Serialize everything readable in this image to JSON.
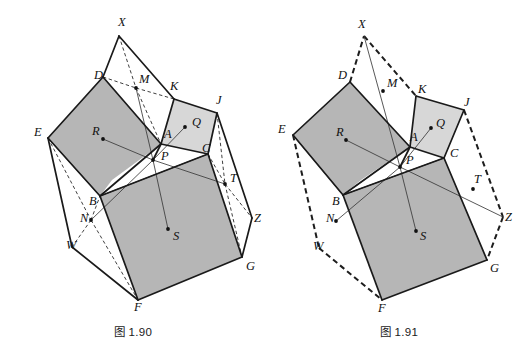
{
  "page": {
    "background": "#ffffff",
    "width": 532,
    "height": 357
  },
  "style": {
    "stroke_color": "#1a1a1a",
    "fill_dark_gray": "#b6b6b6",
    "fill_light_gray": "#d7d7d7",
    "fill_white": "#ffffff",
    "thin_line": "#333333"
  },
  "figures": [
    {
      "id": "fig-1-90",
      "caption": "图 1.90",
      "labels": [
        {
          "name": "X",
          "text": "X",
          "x": 118,
          "y": 26
        },
        {
          "name": "D",
          "text": "D",
          "x": 94,
          "y": 79
        },
        {
          "name": "M",
          "text": "M",
          "x": 139,
          "y": 83
        },
        {
          "name": "K",
          "text": "K",
          "x": 170,
          "y": 90
        },
        {
          "name": "J",
          "text": "J",
          "x": 216,
          "y": 104
        },
        {
          "name": "E",
          "text": "E",
          "x": 34,
          "y": 136
        },
        {
          "name": "R",
          "text": "R",
          "x": 92,
          "y": 135
        },
        {
          "name": "Q",
          "text": "Q",
          "x": 192,
          "y": 126
        },
        {
          "name": "A",
          "text": "A",
          "x": 164,
          "y": 138
        },
        {
          "name": "P",
          "text": "P",
          "x": 161,
          "y": 160
        },
        {
          "name": "C",
          "text": "C",
          "x": 202,
          "y": 152
        },
        {
          "name": "T",
          "text": "T",
          "x": 230,
          "y": 182
        },
        {
          "name": "B",
          "text": "B",
          "x": 89,
          "y": 205
        },
        {
          "name": "N",
          "text": "N",
          "x": 80,
          "y": 222
        },
        {
          "name": "Z",
          "text": "Z",
          "x": 254,
          "y": 222
        },
        {
          "name": "W",
          "text": "W",
          "x": 66,
          "y": 249
        },
        {
          "name": "S",
          "text": "S",
          "x": 173,
          "y": 240
        },
        {
          "name": "G",
          "text": "G",
          "x": 246,
          "y": 270
        },
        {
          "name": "F",
          "text": "F",
          "x": 134,
          "y": 311
        }
      ],
      "points": [
        {
          "name": "M",
          "x": 136,
          "y": 88
        },
        {
          "name": "Q",
          "x": 185,
          "y": 127
        },
        {
          "name": "R",
          "x": 103,
          "y": 139
        },
        {
          "name": "P",
          "x": 153,
          "y": 160
        },
        {
          "name": "T",
          "x": 225,
          "y": 184
        },
        {
          "name": "N",
          "x": 91,
          "y": 220
        },
        {
          "name": "S",
          "x": 168,
          "y": 229
        }
      ]
    },
    {
      "id": "fig-1-91",
      "caption": "图 1.91",
      "labels": [
        {
          "name": "X",
          "text": "X",
          "x": 92,
          "y": 28
        },
        {
          "name": "D",
          "text": "D",
          "x": 72,
          "y": 79
        },
        {
          "name": "M",
          "text": "M",
          "x": 121,
          "y": 87
        },
        {
          "name": "K",
          "text": "K",
          "x": 152,
          "y": 93
        },
        {
          "name": "J",
          "text": "J",
          "x": 198,
          "y": 106
        },
        {
          "name": "E",
          "text": "E",
          "x": 12,
          "y": 133
        },
        {
          "name": "R",
          "text": "R",
          "x": 70,
          "y": 136
        },
        {
          "name": "Q",
          "text": "Q",
          "x": 170,
          "y": 127
        },
        {
          "name": "A",
          "text": "A",
          "x": 144,
          "y": 141
        },
        {
          "name": "P",
          "text": "P",
          "x": 140,
          "y": 164
        },
        {
          "name": "C",
          "text": "C",
          "x": 184,
          "y": 157
        },
        {
          "name": "T",
          "text": "T",
          "x": 208,
          "y": 183
        },
        {
          "name": "B",
          "text": "B",
          "x": 66,
          "y": 205
        },
        {
          "name": "N",
          "text": "N",
          "x": 60,
          "y": 222
        },
        {
          "name": "Z",
          "text": "Z",
          "x": 239,
          "y": 221
        },
        {
          "name": "W",
          "text": "W",
          "x": 47,
          "y": 250
        },
        {
          "name": "S",
          "text": "S",
          "x": 154,
          "y": 240
        },
        {
          "name": "G",
          "text": "G",
          "x": 224,
          "y": 272
        },
        {
          "name": "F",
          "text": "F",
          "x": 112,
          "y": 312
        }
      ],
      "points": [
        {
          "name": "M",
          "x": 117,
          "y": 91
        },
        {
          "name": "Q",
          "x": 165,
          "y": 128
        },
        {
          "name": "R",
          "x": 80,
          "y": 140
        },
        {
          "name": "P",
          "x": 134,
          "y": 167
        },
        {
          "name": "T",
          "x": 207,
          "y": 189
        },
        {
          "name": "N",
          "x": 70,
          "y": 221
        },
        {
          "name": "S",
          "x": 150,
          "y": 231
        }
      ]
    }
  ]
}
